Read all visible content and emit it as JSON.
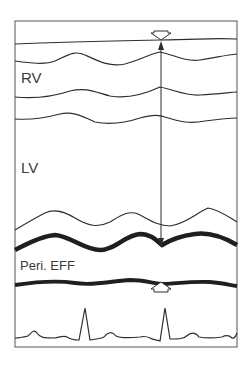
{
  "figure": {
    "type": "M-mode echocardiogram schematic",
    "labels": {
      "rv": "RV",
      "lv": "LV",
      "effusion": "Peri. EFF"
    },
    "traces": [
      {
        "name": "anterior-chest-wall",
        "weight": "thin"
      },
      {
        "name": "rv-anterior-wall",
        "weight": "thin"
      },
      {
        "name": "interventricular-septum-rv-side",
        "weight": "thin"
      },
      {
        "name": "interventricular-septum-lv-side",
        "weight": "thin"
      },
      {
        "name": "lv-posterior-endocardium",
        "weight": "thin"
      },
      {
        "name": "lv-posterior-epicardium",
        "weight": "thick"
      },
      {
        "name": "pericardium",
        "weight": "thick"
      },
      {
        "name": "ecg",
        "weight": "thin"
      }
    ],
    "markers": [
      {
        "name": "top-open-arrow",
        "direction": "down"
      },
      {
        "name": "bottom-open-arrow",
        "direction": "up"
      },
      {
        "name": "double-headed-measurement-arrow",
        "direction": "vertical"
      }
    ],
    "colors": {
      "line": "#2e2e2e",
      "frame": "#555555",
      "background": "#ffffff"
    }
  }
}
